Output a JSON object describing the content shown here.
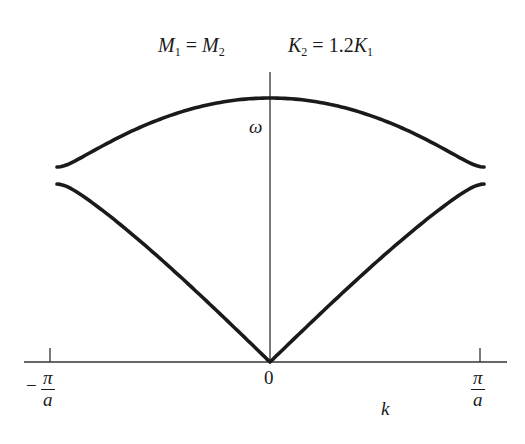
{
  "title": {
    "left": {
      "symbol": "M",
      "sub1": "1",
      "eq": " = ",
      "symbol2": "M",
      "sub2": "2"
    },
    "right": {
      "symbol": "K",
      "sub1": "2",
      "eq": " = ",
      "coef": "1.2",
      "symbol2": "K",
      "sub2": "1"
    }
  },
  "axes": {
    "y_label": "ω",
    "x_label": "k",
    "origin_label": "0",
    "left_tick": {
      "sign": "−",
      "num": "π",
      "den": "a"
    },
    "right_tick": {
      "num": "π",
      "den": "a"
    }
  },
  "colors": {
    "curve": "#1a1a1a",
    "axis": "#333333",
    "background": "#ffffff"
  },
  "chart_data": {
    "type": "line",
    "title": "M1 = M2    K2 = 1.2K1",
    "xlabel": "k",
    "ylabel": "ω",
    "xlim": [
      "-π/a",
      "π/a"
    ],
    "x_ticks": [
      "-π/a",
      "0",
      "π/a"
    ],
    "params": {
      "M1": 1,
      "M2": 1,
      "K1": 1,
      "K2": 1.2
    },
    "series": [
      {
        "name": "optical branch",
        "omega_at_k0": 2.098,
        "omega_at_zone_edge": 1.549
      },
      {
        "name": "acoustic branch",
        "omega_at_k0": 0,
        "omega_at_zone_edge": 1.414
      }
    ],
    "grid": false,
    "legend": "none"
  }
}
